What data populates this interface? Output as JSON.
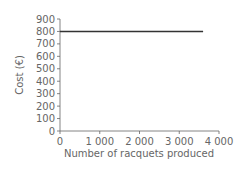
{
  "chart_data": {
    "type": "line",
    "title": "",
    "xlabel": "Number of racquets produced",
    "ylabel": "Cost (€)",
    "x_ticks": [
      "0",
      "1 000",
      "2 000",
      "3 000",
      "4 000"
    ],
    "y_ticks": [
      "0",
      "100",
      "200",
      "300",
      "400",
      "500",
      "600",
      "700",
      "800",
      "900"
    ],
    "xlim": [
      0,
      4000
    ],
    "ylim": [
      0,
      900
    ],
    "grid": false,
    "series": [
      {
        "name": "Fixed cost",
        "x": [
          0,
          3600
        ],
        "y": [
          800,
          800
        ],
        "color": "#333333"
      }
    ]
  }
}
